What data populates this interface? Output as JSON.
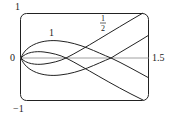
{
  "figure": {
    "type": "parametric-curve-plot",
    "frame": {
      "x_min": 0,
      "x_max": 1.5,
      "y_min": -1,
      "y_max": 1,
      "stroke": "#222222"
    },
    "axis_labels": {
      "y_top": "1",
      "y_bottom": "−1",
      "x_left": "0",
      "x_right": "1.5"
    },
    "curve_labels": [
      {
        "text": "1",
        "curve": "outer"
      },
      {
        "numerator": "1",
        "denominator": "2",
        "curve": "inner"
      }
    ],
    "colors": {
      "curves": "#222222",
      "axis": "#888888",
      "background": "#ffffff"
    }
  }
}
